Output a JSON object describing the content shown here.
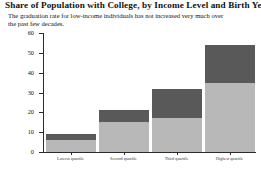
{
  "title": "Share of Population with College, by Income Level and Birth Year",
  "subtitle": "The graduation rate for low-income individuals has not increased very much over the past few decades.",
  "colors": {
    "older_cohort": "#b8b8b8",
    "newer_cohort": "#595959",
    "axis": "#2b2b2b",
    "background": "#ffffff"
  },
  "chart_data": {
    "type": "bar",
    "stacked": true,
    "title": "Share of Population with College, by Income Level and Birth Year",
    "subtitle": "The graduation rate for low-income individuals has not increased very much over the past few decades.",
    "xlabel": "",
    "ylabel": "Percent of population with college degree",
    "ylim": [
      0,
      60
    ],
    "yticks": [
      0,
      10,
      20,
      30,
      40,
      50,
      60
    ],
    "ytick_labels": [
      "0",
      "10",
      "20",
      "30",
      "40",
      "50",
      "60"
    ],
    "grid": false,
    "legend": "none",
    "categories": [
      "Lowest quartile",
      "Second quartile",
      "Third quartile",
      "Highest quartile"
    ],
    "series": [
      {
        "name": "Earlier birth cohort",
        "values": [
          6,
          15,
          17,
          35
        ]
      },
      {
        "name": "Later birth cohort",
        "values": [
          3,
          6,
          15,
          19
        ]
      }
    ],
    "totals": [
      9,
      21,
      32,
      54
    ]
  }
}
